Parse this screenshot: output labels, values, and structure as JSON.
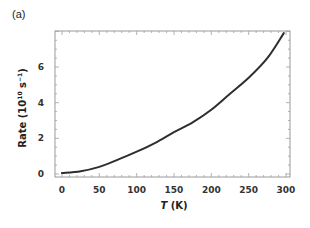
{
  "panel_label": "(a)",
  "chart_data": {
    "type": "line",
    "title": "",
    "xlabel": "T (K)",
    "xlabel_parts": {
      "var": "T",
      "unit": " (K)"
    },
    "ylabel": "Rate (10^10 s^-1)",
    "ylabel_parts": {
      "text": "Rate (10",
      "exp1": "10",
      "mid": " s",
      "exp2": "−1",
      "end": ")"
    },
    "xlim": [
      -5,
      310
    ],
    "ylim": [
      -0.2,
      8.0
    ],
    "xticks": [
      0,
      50,
      100,
      150,
      200,
      250,
      300
    ],
    "yticks": [
      0,
      2,
      4,
      6
    ],
    "grid": false,
    "legend": null,
    "series": [
      {
        "name": "Rate",
        "color": "#2e2e2e",
        "x": [
          0,
          25,
          50,
          75,
          100,
          125,
          150,
          175,
          200,
          225,
          250,
          275,
          297
        ],
        "y": [
          0.05,
          0.15,
          0.4,
          0.8,
          1.25,
          1.75,
          2.35,
          2.9,
          3.6,
          4.5,
          5.4,
          6.5,
          7.9
        ]
      }
    ]
  }
}
